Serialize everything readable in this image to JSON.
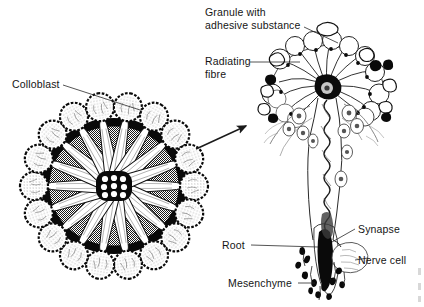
{
  "figure": {
    "background_color": "#ffffff",
    "ink_color": "#111111",
    "halftone_gray": "#9a9a9a"
  },
  "labels": {
    "colloblast": "Colloblast",
    "granule_line1": "Granule with",
    "granule_line2": "adhesive substance",
    "radiating_line1": "Radiating",
    "radiating_line2": "fibre",
    "synapse": "Synapse",
    "nerve_cell": "Nerve cell",
    "root": "Root",
    "mesenchyme": "Mesenchyme"
  },
  "left_panel": {
    "name": "colloblast-rosette-cross-section",
    "center_x": 114,
    "center_y": 186,
    "disc_radius_x": 68,
    "disc_radius_y": 63,
    "ring_segments": 18,
    "colloblast_count": 18,
    "central_nucleus_dots": 9
  },
  "right_panel": {
    "name": "single-colloblast-enlarged",
    "granule_count": 14,
    "radiating_fibre_count": 14,
    "head_center_x": 327,
    "head_center_y": 87
  },
  "arrow": {
    "name": "magnification-arrow",
    "x1": 196,
    "y1": 149,
    "x2": 248,
    "y2": 125
  }
}
